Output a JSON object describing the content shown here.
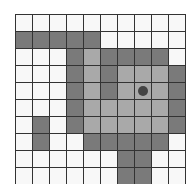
{
  "board": {
    "rows": 10,
    "cols": 10,
    "legend": {
      "W": "empty",
      "D": "dark-cell",
      "L": "light-cell"
    },
    "colors": {
      "W": "#f8f8f8",
      "D": "#7a7a7a",
      "L": "#a9a9a9",
      "grid": "#333333",
      "marker": "#444444"
    },
    "cells": [
      "WWWWWWWWWW",
      "DDDDDWWWWW",
      "WWWDLDDDDW",
      "WWWDLDLLLD",
      "WWWDLDLLLD",
      "WWWDLLLLLD",
      "WDWDLLLLLD",
      "WDWWDDDDDW",
      "WWWWWWDDWW",
      "WWWWWWDDWW"
    ],
    "marker": {
      "row": 4,
      "col": 7,
      "name": "player-marker"
    }
  }
}
